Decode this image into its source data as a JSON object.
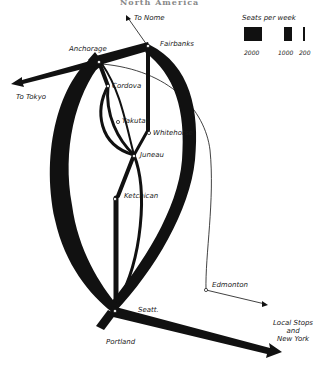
{
  "title": "North America",
  "legend": {
    "title": "Seats per week",
    "items": [
      {
        "label": "2000",
        "width": 16
      },
      {
        "label": "1000",
        "width": 8
      },
      {
        "label": "200",
        "width": 2
      }
    ]
  },
  "cities": {
    "anchorage": "Anchorage",
    "fairbanks": "Fairbanks",
    "cordova": "Cordova",
    "yakutat": "Yakutat",
    "whitehorse": "Whitehorse",
    "juneau": "Juneau",
    "ketchikan": "Ketchican",
    "edmonton": "Edmonton",
    "seattle": "Seatt.",
    "portland": "Portland"
  },
  "destinations": {
    "nome": "To Nome",
    "tokyo": "To Tokyo",
    "local_ny_line1": "Local Stops",
    "local_ny_line2": "and",
    "local_ny_line3": "New York"
  },
  "colors": {
    "flow": "#111111",
    "background": "#ffffff"
  }
}
